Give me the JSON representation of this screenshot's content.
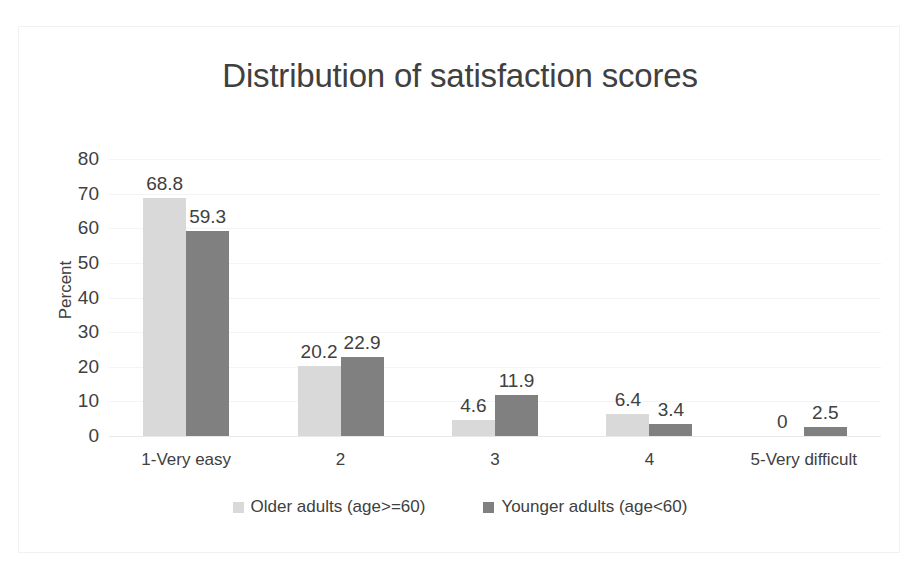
{
  "chart_data": {
    "type": "bar",
    "title": "Distribution of satisfaction scores",
    "xlabel": "",
    "ylabel": "Percent",
    "ylim": [
      0,
      80
    ],
    "yticks": [
      80,
      70,
      60,
      50,
      40,
      30,
      20,
      10,
      0
    ],
    "grid": true,
    "legend_position": "bottom",
    "categories": [
      "1-Very easy",
      "2",
      "3",
      "4",
      "5-Very difficult"
    ],
    "series": [
      {
        "name": "Older adults (age>=60)",
        "color": "#D9D9D9",
        "values": [
          68.8,
          20.2,
          4.6,
          6.4,
          0
        ],
        "labels": [
          "68.8",
          "20.2",
          "4.6",
          "6.4",
          "0"
        ]
      },
      {
        "name": "Younger adults (age<60)",
        "color": "#808080",
        "values": [
          59.3,
          22.9,
          11.9,
          3.4,
          2.5
        ],
        "labels": [
          "59.3",
          "22.9",
          "11.9",
          "3.4",
          "2.5"
        ]
      }
    ]
  },
  "colors": {
    "text": "#404040",
    "older": "#D9D9D9",
    "younger": "#808080",
    "gridline": "#F4F4F4",
    "frame": "#F2F2F2"
  }
}
